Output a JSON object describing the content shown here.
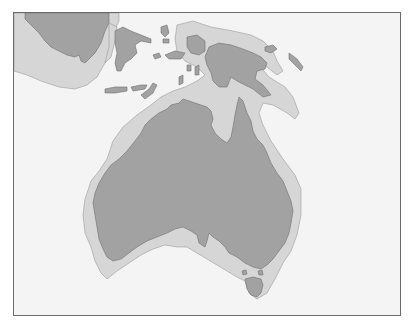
{
  "map": {
    "title": "",
    "region": "Australia and New Guinea (Sahul) with exposed continental shelf",
    "legend": [],
    "colors": {
      "ocean": "#f4f4f4",
      "shelf": "#d6d6d6",
      "land": "#a2a2a2",
      "frame": "#6b6b6b"
    },
    "features": [
      {
        "name": "australia",
        "type": "land"
      },
      {
        "name": "tasmania",
        "type": "land"
      },
      {
        "name": "new-guinea",
        "type": "land"
      },
      {
        "name": "borneo",
        "type": "land"
      },
      {
        "name": "sulawesi",
        "type": "land"
      },
      {
        "name": "lesser-sunda-islands",
        "type": "land"
      },
      {
        "name": "maluku-islands",
        "type": "land"
      },
      {
        "name": "sahul-shelf",
        "type": "shelf"
      },
      {
        "name": "sunda-shelf",
        "type": "shelf"
      }
    ]
  }
}
